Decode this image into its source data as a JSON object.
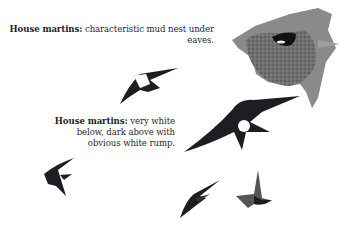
{
  "captions": [
    {
      "title": "House martins:",
      "body": "characteristic mud nest under eaves."
    },
    {
      "title": "House martins:",
      "body_line1": "very white",
      "body_line2": "below, dark above with",
      "body_line3": "obvious white rump."
    }
  ],
  "illustrations": [
    {
      "name": "mud-nest-under-eaves",
      "position": "top-right"
    },
    {
      "name": "house-martin-flying-upper",
      "position": "upper-center"
    },
    {
      "name": "house-martin-flying-large",
      "position": "center-right"
    },
    {
      "name": "house-martin-flying-left",
      "position": "lower-left"
    },
    {
      "name": "house-martin-flying-lower-center",
      "position": "lower-center"
    },
    {
      "name": "house-martin-gliding-right",
      "position": "lower-right"
    }
  ],
  "colors": {
    "bird_dark": "#1e1e22",
    "nest": "#6e6e6e",
    "background": "#ffffff"
  }
}
